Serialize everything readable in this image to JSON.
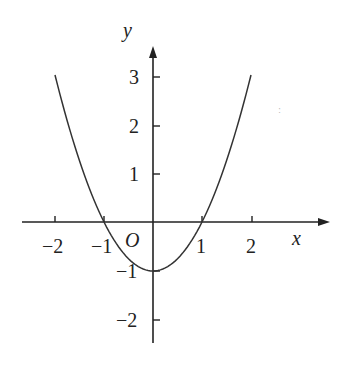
{
  "chart_data": {
    "type": "line",
    "title": "",
    "function": "y = x^2 - 1",
    "xlabel": "x",
    "ylabel": "y",
    "origin_label": "O",
    "x_ticks": [
      "-2",
      "-1",
      "1",
      "2"
    ],
    "y_ticks": [
      "3",
      "2",
      "1",
      "-1",
      "-2"
    ],
    "xlim": [
      -2.6,
      3.6
    ],
    "ylim": [
      -2.5,
      3.6
    ],
    "grid": false,
    "series": [
      {
        "name": "y = x^2 - 1",
        "x": [
          -2,
          -1.5,
          -1,
          -0.5,
          0,
          0.5,
          1,
          1.5,
          2
        ],
        "y": [
          3,
          1.25,
          0,
          -0.75,
          -1,
          -0.75,
          0,
          1.25,
          3
        ]
      }
    ]
  },
  "axes": {
    "x_label": "x",
    "y_label": "y",
    "origin": "O",
    "x_tick_labels": [
      "−2",
      "−1",
      "1",
      "2"
    ],
    "y_tick_labels": [
      "3",
      "2",
      "1",
      "−1",
      "−2"
    ]
  }
}
